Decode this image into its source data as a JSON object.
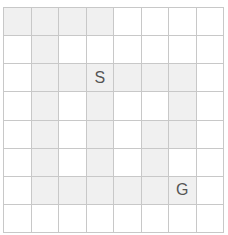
{
  "grid": {
    "rows": 8,
    "cols": 8,
    "colors": {
      "path": "#f0f0f0",
      "empty": "#ffffff",
      "line": "#c8c8c8",
      "label": "#555555"
    },
    "shaded": [
      [
        0,
        0
      ],
      [
        0,
        1
      ],
      [
        0,
        2
      ],
      [
        0,
        3
      ],
      [
        1,
        1
      ],
      [
        2,
        1
      ],
      [
        2,
        2
      ],
      [
        2,
        3
      ],
      [
        2,
        4
      ],
      [
        2,
        5
      ],
      [
        2,
        6
      ],
      [
        3,
        1
      ],
      [
        3,
        3
      ],
      [
        3,
        6
      ],
      [
        4,
        1
      ],
      [
        4,
        3
      ],
      [
        4,
        5
      ],
      [
        4,
        6
      ],
      [
        5,
        1
      ],
      [
        5,
        3
      ],
      [
        5,
        5
      ],
      [
        6,
        1
      ],
      [
        6,
        2
      ],
      [
        6,
        3
      ],
      [
        6,
        4
      ],
      [
        6,
        5
      ],
      [
        6,
        6
      ]
    ],
    "labels": [
      {
        "row": 2,
        "col": 3,
        "text": "S",
        "name": "start-cell"
      },
      {
        "row": 6,
        "col": 6,
        "text": "G",
        "name": "goal-cell"
      }
    ]
  }
}
